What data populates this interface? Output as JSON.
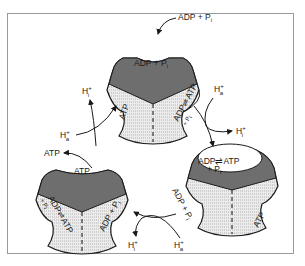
{
  "diagram": {
    "type": "binding-change mechanism of ATP synthase",
    "colors": {
      "catalytic_dark": "#6e6e6e",
      "subunit_light": "#e4e4e4",
      "outline": "#1a1a1a",
      "frame": "#9a9a9a"
    },
    "top_subunit": {
      "external_input": "ADP + P",
      "external_input_sub": "i",
      "site_label": "ADP + P",
      "site_label_sub": "i",
      "left_face": "ATP",
      "right_face_line1": "ADP⇌ATP",
      "right_face_line2": "+ P",
      "right_face_line2_sub": "i"
    },
    "right_subunit": {
      "site_label_line1": "ADP⇌ATP",
      "site_label_line2": "+ P",
      "site_label_line2_sub": "i",
      "right_face": "ATP",
      "left_face": "ADP + P",
      "left_face_sub": "i"
    },
    "left_subunit": {
      "site_label": "ATP",
      "external_output": "ATP",
      "left_face_line1": "ADP⇌ATP",
      "left_face_line2": "+ P",
      "left_face_line2_sub": "i",
      "right_face": "ADP + P",
      "right_face_sub": "i"
    },
    "proton_flows": [
      {
        "position": "upper-left",
        "in": "H",
        "in_sup": "+",
        "in_sub": "a",
        "out": "H",
        "out_sup": "+",
        "out_sub": "i"
      },
      {
        "position": "upper-right",
        "in": "H",
        "in_sup": "+",
        "in_sub": "a",
        "out": "H",
        "out_sup": "+",
        "out_sub": "i"
      },
      {
        "position": "bottom",
        "in": "H",
        "in_sup": "+",
        "in_sub": "a",
        "out": "H",
        "out_sup": "+",
        "out_sub": "i"
      }
    ]
  }
}
